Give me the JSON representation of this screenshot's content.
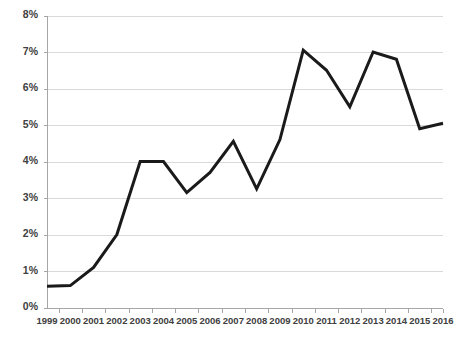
{
  "chart_data": {
    "type": "line",
    "title": "",
    "subtitle": "",
    "xlabel": "",
    "ylabel": "",
    "categories": [
      "1999",
      "2000",
      "2001",
      "2002",
      "2003",
      "2004",
      "2005",
      "2006",
      "2007",
      "2008",
      "2009",
      "2010",
      "2011",
      "2012",
      "2013",
      "2014",
      "2015",
      "2016"
    ],
    "values": [
      0.58,
      0.6,
      1.1,
      2.0,
      4.0,
      4.0,
      3.15,
      3.7,
      4.55,
      3.25,
      4.6,
      7.05,
      6.5,
      5.5,
      7.0,
      6.8,
      4.9,
      5.05
    ],
    "series": [
      {
        "name": "",
        "values": [
          0.58,
          0.6,
          1.1,
          2.0,
          4.0,
          4.0,
          3.15,
          3.7,
          4.55,
          3.25,
          4.6,
          7.05,
          6.5,
          5.5,
          7.0,
          6.8,
          4.9,
          5.05
        ]
      }
    ],
    "ylim": [
      0,
      8
    ],
    "ytick_values": [
      0,
      1,
      2,
      3,
      4,
      5,
      6,
      7,
      8
    ],
    "ytick_labels": [
      "0%",
      "1%",
      "2%",
      "3%",
      "4%",
      "5%",
      "6%",
      "7%",
      "8%"
    ],
    "xtick_labels": [
      "1999",
      "2000",
      "2001",
      "2002",
      "2003",
      "2004",
      "2005",
      "2006",
      "2007",
      "2008",
      "2009",
      "2010",
      "2011",
      "2012",
      "2013",
      "2014",
      "2015",
      "2016"
    ],
    "grid": true,
    "grid_axis": "y",
    "legend": false,
    "legend_position": "none",
    "annotations": [],
    "colors": {
      "line": "#1a1a1a",
      "gridline": "#d9d9d9",
      "axis": "#a6a6a6",
      "tick_label": "#404040",
      "background": "#ffffff"
    },
    "style": {
      "line_width": 3,
      "markers": false
    }
  }
}
